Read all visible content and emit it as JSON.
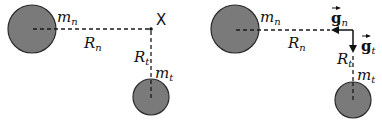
{
  "left_panel": {
    "mass_n": {
      "label": "m",
      "sub": "n"
    },
    "mass_t": {
      "label": "m",
      "sub": "t"
    },
    "distance_n": {
      "label": "R",
      "sub": "n"
    },
    "distance_t": {
      "label": "R",
      "sub": "t"
    },
    "point_label": "X"
  },
  "right_panel": {
    "mass_n": {
      "label": "m",
      "sub": "n"
    },
    "mass_t": {
      "label": "m",
      "sub": "t"
    },
    "distance_n": {
      "label": "R",
      "sub": "n"
    },
    "distance_t": {
      "label": "R",
      "sub": "t"
    },
    "field_n": {
      "label": "g",
      "sub": "n"
    },
    "field_t": {
      "label": "g",
      "sub": "t"
    }
  },
  "colors": {
    "mass_fill": "#7a7a7a",
    "stroke": "#111111"
  }
}
